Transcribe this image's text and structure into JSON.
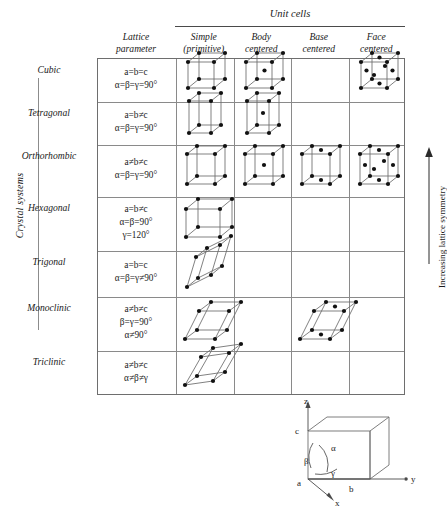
{
  "header": {
    "super_title": "Unit cells",
    "columns": [
      {
        "id": "lattice-parameter",
        "line1": "Lattice",
        "line2": "parameter"
      },
      {
        "id": "simple",
        "line1": "Simple",
        "line2": "(primitive)"
      },
      {
        "id": "body-centered",
        "line1": "Body",
        "line2": "centered"
      },
      {
        "id": "base-centered",
        "line1": "Base",
        "line2": "centered"
      },
      {
        "id": "face-centered",
        "line1": "Face",
        "line2": "centered"
      }
    ]
  },
  "axis_labels": {
    "left": "Crystal systems",
    "right": "Increasing lattice symmetry"
  },
  "rows": [
    {
      "system": "Cubic",
      "params": [
        "a=b=c",
        "α=β=γ=90°"
      ],
      "cells": {
        "simple": true,
        "body": true,
        "base": false,
        "face": true
      },
      "shape": "cube"
    },
    {
      "system": "Tetragonal",
      "params": [
        "a=b≠c",
        "α=β=γ=90°"
      ],
      "cells": {
        "simple": true,
        "body": true,
        "base": false,
        "face": false
      },
      "shape": "tall"
    },
    {
      "system": "Orthorhombic",
      "params": [
        "a≠b≠c",
        "α=β=γ=90°"
      ],
      "cells": {
        "simple": true,
        "body": true,
        "base": true,
        "face": true
      },
      "shape": "ortho"
    },
    {
      "system": "Hexagonal",
      "params": [
        "a=b≠c",
        "α=β=90°",
        "γ=120°"
      ],
      "cells": {
        "simple": true,
        "body": false,
        "base": false,
        "face": false
      },
      "shape": "wide"
    },
    {
      "system": "Trigonal",
      "params": [
        "a=b=c",
        "α=β=γ≠90°"
      ],
      "cells": {
        "simple": true,
        "body": false,
        "base": false,
        "face": false
      },
      "shape": "rhomb"
    },
    {
      "system": "Monoclinic",
      "params": [
        "a≠b≠c",
        "β=γ=90°",
        "α≠90°"
      ],
      "cells": {
        "simple": true,
        "body": false,
        "base": true,
        "face": false
      },
      "shape": "mono"
    },
    {
      "system": "Triclinic",
      "params": [
        "a≠b≠c",
        "α≠β≠γ"
      ],
      "cells": {
        "simple": true,
        "body": false,
        "base": false,
        "face": false
      },
      "shape": "tric"
    }
  ],
  "axes_diagram": {
    "axis_x": "x",
    "axis_y": "y",
    "axis_z": "z",
    "edge_a": "a",
    "edge_b": "b",
    "edge_c": "c",
    "angle_alpha": "α",
    "angle_beta": "β",
    "angle_gamma": "γ"
  },
  "colors": {
    "ink": "#1a1a1a",
    "rule": "#8a8a8a",
    "atom": "#111111"
  }
}
